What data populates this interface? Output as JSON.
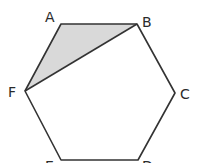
{
  "diagram": {
    "type": "geometry",
    "shape": "regular hexagon",
    "vertices": [
      {
        "label": "A",
        "x": 61,
        "y": 24,
        "lx": 45,
        "ly": 22
      },
      {
        "label": "B",
        "x": 137,
        "y": 24,
        "lx": 142,
        "ly": 27
      },
      {
        "label": "C",
        "x": 175,
        "y": 93,
        "lx": 180,
        "ly": 99
      },
      {
        "label": "D",
        "x": 138,
        "y": 160,
        "lx": 142,
        "ly": 171
      },
      {
        "label": "E",
        "x": 61,
        "y": 160,
        "lx": 45,
        "ly": 171
      },
      {
        "label": "F",
        "x": 25,
        "y": 91,
        "lx": 8,
        "ly": 97
      }
    ],
    "shaded_triangle": [
      "A",
      "B",
      "F"
    ],
    "diagonal": [
      "F",
      "B"
    ],
    "colors": {
      "stroke": "#333333",
      "shade": "#d9d9d9",
      "background": "#ffffff"
    }
  }
}
